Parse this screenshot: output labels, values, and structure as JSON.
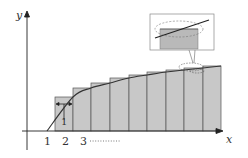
{
  "diagram": {
    "type": "riemann-sum-upper-rectangles",
    "axes": {
      "x_label": "x",
      "y_label": "y"
    },
    "ticks": [
      {
        "label": "1",
        "x": 47
      },
      {
        "label": "2",
        "x": 65
      },
      {
        "label": "3",
        "x": 83
      }
    ],
    "ellipsis": "··········",
    "width_marker_label": "1",
    "rectangles": [
      {
        "x0": 55,
        "x1": 73,
        "top": 97
      },
      {
        "x0": 73,
        "x1": 91,
        "top": 88
      },
      {
        "x0": 91,
        "x1": 110,
        "top": 83
      },
      {
        "x0": 110,
        "x1": 129,
        "top": 78
      },
      {
        "x0": 129,
        "x1": 147,
        "top": 75
      },
      {
        "x0": 147,
        "x1": 166,
        "top": 72
      },
      {
        "x0": 166,
        "x1": 184,
        "top": 70
      },
      {
        "x0": 184,
        "x1": 203,
        "top": 68
      },
      {
        "x0": 203,
        "x1": 221,
        "top": 66
      }
    ],
    "colors": {
      "fill": "#c8c8c8",
      "stroke": "#444444",
      "axis": "#222222",
      "callout_fill": "#b9b9b9"
    },
    "callout": {
      "description": "magnified view of curve crossing rectangle top"
    }
  }
}
